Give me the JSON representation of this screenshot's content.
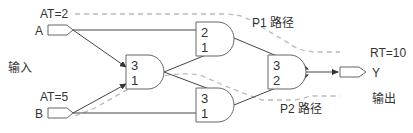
{
  "inputs_label": "输入",
  "output_label": "输出",
  "inputs": [
    {
      "name": "A",
      "arrival": "AT=2"
    },
    {
      "name": "B",
      "arrival": "AT=5"
    }
  ],
  "output": {
    "name": "Y",
    "required": "RT=10"
  },
  "paths": {
    "p1": "P1 路径",
    "p2": "P2 路径"
  },
  "gates": [
    {
      "id": "g1",
      "top": "3",
      "bottom": "1"
    },
    {
      "id": "g2",
      "top": "2",
      "bottom": "1"
    },
    {
      "id": "g3",
      "top": "3",
      "bottom": "1"
    },
    {
      "id": "g4",
      "top": "3",
      "bottom": "2"
    }
  ],
  "colors": {
    "line": "#444444",
    "dash": "#bbbbbb",
    "text": "#333333"
  }
}
